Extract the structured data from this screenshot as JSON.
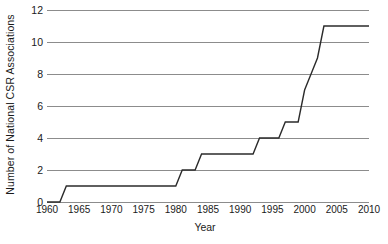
{
  "chart_data": {
    "type": "line",
    "title": "",
    "xlabel": "Year",
    "ylabel": "Number of National CSR Associations",
    "xlim": [
      1960,
      2010
    ],
    "ylim": [
      0,
      12
    ],
    "grid": true,
    "legend": null,
    "line_color": "#2b2b2b",
    "grid_color": "#8c8c8c",
    "xticks": [
      1960,
      1965,
      1970,
      1975,
      1980,
      1985,
      1990,
      1995,
      2000,
      2005,
      2010
    ],
    "yticks": [
      0,
      2,
      4,
      6,
      8,
      10,
      12
    ],
    "x": [
      1960,
      1961,
      1962,
      1963,
      1964,
      1965,
      1966,
      1967,
      1968,
      1969,
      1970,
      1971,
      1972,
      1973,
      1974,
      1975,
      1976,
      1977,
      1978,
      1979,
      1980,
      1981,
      1982,
      1983,
      1984,
      1985,
      1986,
      1987,
      1988,
      1989,
      1990,
      1991,
      1992,
      1993,
      1994,
      1995,
      1996,
      1997,
      1998,
      1999,
      2000,
      2001,
      2002,
      2003,
      2004,
      2005,
      2006,
      2007,
      2008,
      2009,
      2010
    ],
    "values": [
      0,
      0,
      0,
      1,
      1,
      1,
      1,
      1,
      1,
      1,
      1,
      1,
      1,
      1,
      1,
      1,
      1,
      1,
      1,
      1,
      1,
      2,
      2,
      2,
      3,
      3,
      3,
      3,
      3,
      3,
      3,
      3,
      3,
      4,
      4,
      4,
      4,
      5,
      5,
      5,
      7,
      8,
      9,
      11,
      11,
      11,
      11,
      11,
      11,
      11,
      11
    ],
    "series": [
      {
        "name": "National CSR Associations",
        "values": [
          0,
          0,
          0,
          1,
          1,
          1,
          1,
          1,
          1,
          1,
          1,
          1,
          1,
          1,
          1,
          1,
          1,
          1,
          1,
          1,
          1,
          2,
          2,
          2,
          3,
          3,
          3,
          3,
          3,
          3,
          3,
          3,
          3,
          4,
          4,
          4,
          4,
          5,
          5,
          5,
          7,
          8,
          9,
          11,
          11,
          11,
          11,
          11,
          11,
          11,
          11
        ]
      }
    ]
  }
}
